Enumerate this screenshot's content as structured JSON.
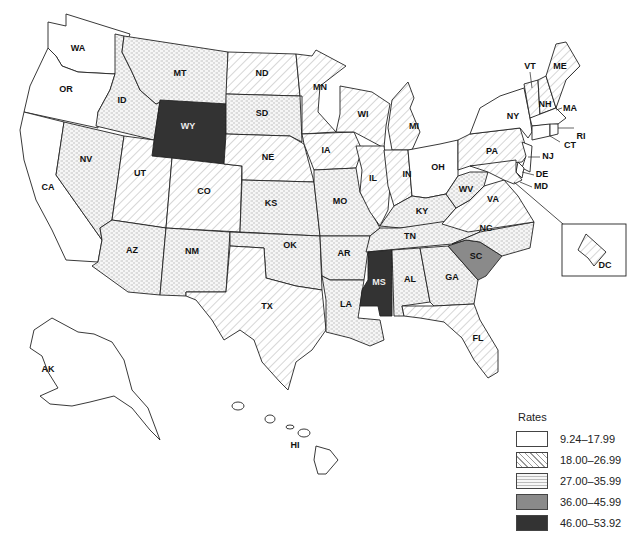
{
  "legend": {
    "title": "Rates",
    "classes": [
      {
        "range": "9.24–17.99",
        "pattern": "white",
        "color": "#ffffff"
      },
      {
        "range": "18.00–26.99",
        "pattern": "hatch",
        "color": "#ffffff"
      },
      {
        "range": "27.00–35.99",
        "pattern": "dots",
        "color": "#f4f4f4"
      },
      {
        "range": "36.00–45.99",
        "pattern": "solid",
        "color": "#8a8a8a"
      },
      {
        "range": "46.00–53.92",
        "pattern": "solid",
        "color": "#333333"
      }
    ]
  },
  "states": {
    "WA": {
      "label": "WA",
      "class": 0
    },
    "OR": {
      "label": "OR",
      "class": 0
    },
    "CA": {
      "label": "CA",
      "class": 0
    },
    "NV": {
      "label": "NV",
      "class": 2
    },
    "ID": {
      "label": "ID",
      "class": 2
    },
    "MT": {
      "label": "MT",
      "class": 2
    },
    "WY": {
      "label": "WY",
      "class": 4
    },
    "UT": {
      "label": "UT",
      "class": 1
    },
    "CO": {
      "label": "CO",
      "class": 1
    },
    "AZ": {
      "label": "AZ",
      "class": 2
    },
    "NM": {
      "label": "NM",
      "class": 2
    },
    "ND": {
      "label": "ND",
      "class": 1
    },
    "SD": {
      "label": "SD",
      "class": 2
    },
    "NE": {
      "label": "NE",
      "class": 1
    },
    "KS": {
      "label": "KS",
      "class": 2
    },
    "OK": {
      "label": "OK",
      "class": 2
    },
    "TX": {
      "label": "TX",
      "class": 1
    },
    "MN": {
      "label": "MN",
      "class": 1
    },
    "IA": {
      "label": "IA",
      "class": 1
    },
    "MO": {
      "label": "MO",
      "class": 2
    },
    "AR": {
      "label": "AR",
      "class": 2
    },
    "LA": {
      "label": "LA",
      "class": 2
    },
    "WI": {
      "label": "WI",
      "class": 1
    },
    "IL": {
      "label": "IL",
      "class": 1
    },
    "MI": {
      "label": "MI",
      "class": 1
    },
    "IN": {
      "label": "IN",
      "class": 1
    },
    "OH": {
      "label": "OH",
      "class": 0
    },
    "KY": {
      "label": "KY",
      "class": 2
    },
    "TN": {
      "label": "TN",
      "class": 2
    },
    "MS": {
      "label": "MS",
      "class": 4
    },
    "AL": {
      "label": "AL",
      "class": 2
    },
    "GA": {
      "label": "GA",
      "class": 2
    },
    "FL": {
      "label": "FL",
      "class": 1
    },
    "SC": {
      "label": "SC",
      "class": 3
    },
    "NC": {
      "label": "NC",
      "class": 2
    },
    "VA": {
      "label": "VA",
      "class": 1
    },
    "WV": {
      "label": "WV",
      "class": 2
    },
    "PA": {
      "label": "PA",
      "class": 1
    },
    "NY": {
      "label": "NY",
      "class": 0
    },
    "VT": {
      "label": "VT",
      "class": 1
    },
    "NH": {
      "label": "NH",
      "class": 1
    },
    "ME": {
      "label": "ME",
      "class": 1
    },
    "MA": {
      "label": "MA",
      "class": 0
    },
    "RI": {
      "label": "RI",
      "class": 0
    },
    "CT": {
      "label": "CT",
      "class": 0
    },
    "NJ": {
      "label": "NJ",
      "class": 0
    },
    "DE": {
      "label": "DE",
      "class": 0
    },
    "MD": {
      "label": "MD",
      "class": 1
    },
    "DC": {
      "label": "DC",
      "class": 1
    },
    "AK": {
      "label": "AK",
      "class": 0
    },
    "HI": {
      "label": "HI",
      "class": 0
    }
  }
}
